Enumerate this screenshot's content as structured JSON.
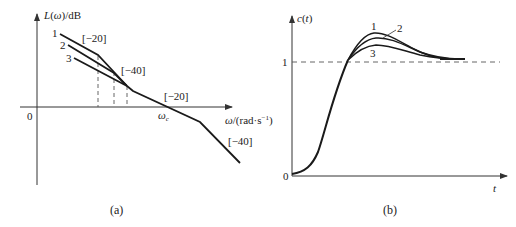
{
  "panel_a": {
    "caption": "(a)",
    "y_axis_label": "L(ω)/dB",
    "x_axis_label": "ω/(rad·s⁻¹)",
    "origin_label": "0",
    "crossover_label": "ωc",
    "curve_labels": [
      "1",
      "2",
      "3"
    ],
    "slope_labels": {
      "first": "[−20]",
      "second": "[−40]",
      "third": "[−20]",
      "fourth": "[−40]"
    }
  },
  "panel_b": {
    "caption": "(b)",
    "y_axis_label": "c(t)",
    "x_axis_label": "t",
    "origin_label": "0",
    "steady_state_label": "1",
    "curve_labels": [
      "1",
      "2",
      "3"
    ]
  },
  "colors": {
    "line": "#1a1a1a",
    "axis": "#333333",
    "dashed": "#555555",
    "background": "#ffffff"
  }
}
